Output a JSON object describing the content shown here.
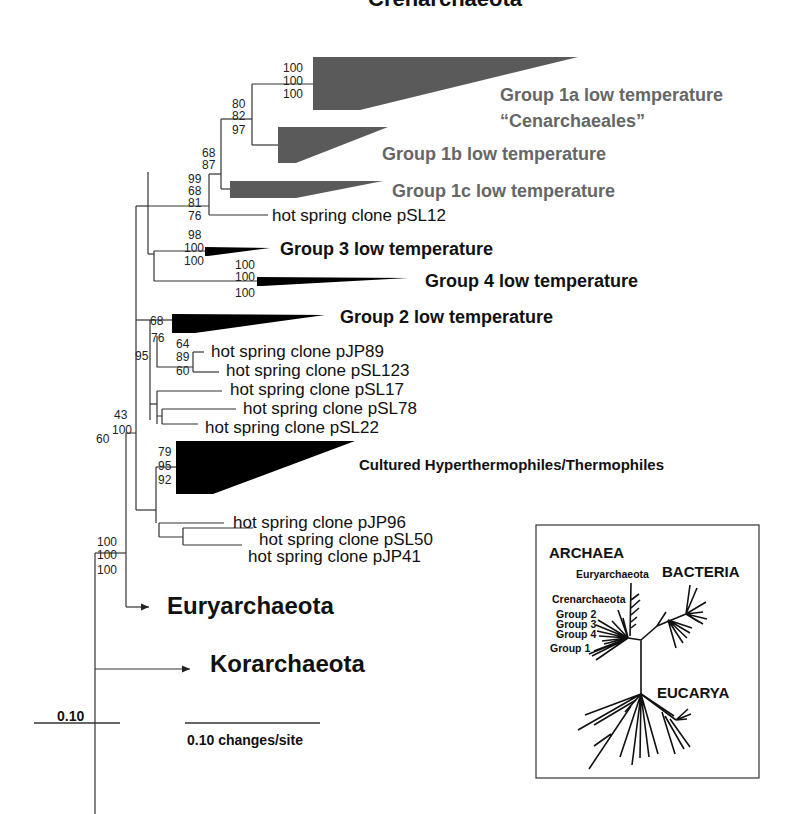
{
  "title": "Crenarchaeota",
  "clades": {
    "group1a": {
      "line1": "Group 1a low temperature",
      "line2": "“Cenarchaeales”",
      "bootstrap": [
        "100",
        "100",
        "100"
      ]
    },
    "group1b": {
      "label": "Group 1b low temperature"
    },
    "group1c": {
      "label": "Group 1c low temperature"
    },
    "group3": {
      "label": "Group 3 low temperature",
      "bootstrap": [
        "98",
        "100",
        "100"
      ]
    },
    "group4": {
      "label": "Group 4 low temperature",
      "bootstrap": [
        "100",
        "100",
        "100"
      ]
    },
    "group2": {
      "label": "Group 2 low temperature",
      "bootstrap": [
        "68"
      ]
    },
    "cultured": {
      "label": "Cultured Hyperthermophiles/Thermophiles",
      "bootstrap": [
        "79",
        "95",
        "92"
      ]
    }
  },
  "nodes": {
    "group1ab": [
      "80",
      "82",
      "97"
    ],
    "group1abc": [
      "68",
      "87"
    ],
    "group1_pSL12": [
      "99",
      "68",
      "81",
      "76"
    ],
    "group2_clones": [
      "76",
      "95"
    ],
    "pJP89_pSL123": [
      "64",
      "89",
      "60"
    ],
    "crenarchaeota_root": [
      "43",
      "100",
      "60"
    ],
    "archaea_root": [
      "100",
      "100",
      "100"
    ]
  },
  "leaves": {
    "pSL12": "hot spring clone pSL12",
    "pJP89": "hot spring clone pJP89",
    "pSL123": "hot spring clone pSL123",
    "pSL17": "hot spring clone pSL17",
    "pSL78": "hot spring clone pSL78",
    "pSL22": "hot spring clone pSL22",
    "pJP96": "hot spring clone pJP96",
    "pSL50": "hot spring clone pSL50",
    "pJP41": "hot spring clone pJP41"
  },
  "outgroups": {
    "euryarchaeota": "Euryarchaeota",
    "korarchaeota": "Korarchaeota"
  },
  "scale": {
    "left": "0.10",
    "right": "0.10 changes/site"
  },
  "inset": {
    "archaea": "ARCHAEA",
    "bacteria": "BACTERIA",
    "eucarya": "EUCARYA",
    "euryarchaeota": "Euryarchaeota",
    "crenarchaeota": "Crenarchaeota",
    "group2": "Group 2",
    "group3": "Group 3",
    "group4": "Group 4",
    "group1": "Group 1"
  },
  "colors": {
    "gray_clade": "#5a5a5a",
    "black_clade": "#000000",
    "gray_label": "#666666"
  }
}
